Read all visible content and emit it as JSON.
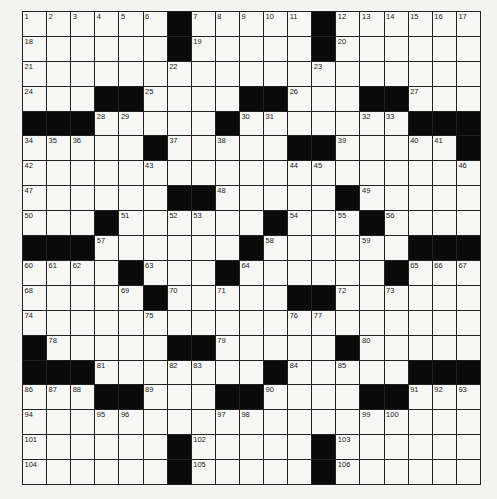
{
  "puzzle": {
    "rows": 19,
    "cols": 19,
    "grid": [
      "......#.....#......",
      "......#.....#......",
      "...................",
      "...##....##...##...",
      "###.....#.......###",
      ".....#.....##.....#",
      "...................",
      "......##.....#.....",
      "...#......#...#....",
      "###......#......###",
      "....#...#......#...",
      ".....#.....##......",
      "...................",
      "#.....##.....#.....",
      "###.......#.....###",
      "...##...##....##...",
      "...................",
      "......#.....#......",
      "......#.....#......"
    ],
    "numbers": [
      {
        "r": 0,
        "c": 0,
        "n": "1"
      },
      {
        "r": 0,
        "c": 1,
        "n": "2"
      },
      {
        "r": 0,
        "c": 2,
        "n": "3"
      },
      {
        "r": 0,
        "c": 3,
        "n": "4"
      },
      {
        "r": 0,
        "c": 4,
        "n": "5"
      },
      {
        "r": 0,
        "c": 5,
        "n": "6"
      },
      {
        "r": 0,
        "c": 7,
        "n": "7"
      },
      {
        "r": 0,
        "c": 8,
        "n": "8"
      },
      {
        "r": 0,
        "c": 9,
        "n": "9"
      },
      {
        "r": 0,
        "c": 10,
        "n": "10"
      },
      {
        "r": 0,
        "c": 11,
        "n": "11"
      },
      {
        "r": 0,
        "c": 13,
        "n": "12"
      },
      {
        "r": 0,
        "c": 14,
        "n": "13"
      },
      {
        "r": 0,
        "c": 15,
        "n": "14"
      },
      {
        "r": 0,
        "c": 16,
        "n": "15"
      },
      {
        "r": 0,
        "c": 17,
        "n": "16"
      },
      {
        "r": 0,
        "c": 18,
        "n": "17"
      },
      {
        "r": 1,
        "c": 0,
        "n": "18"
      },
      {
        "r": 1,
        "c": 7,
        "n": "19"
      },
      {
        "r": 1,
        "c": 13,
        "n": "20"
      },
      {
        "r": 2,
        "c": 0,
        "n": "21"
      },
      {
        "r": 2,
        "c": 6,
        "n": "22"
      },
      {
        "r": 2,
        "c": 12,
        "n": "23"
      },
      {
        "r": 3,
        "c": 0,
        "n": "24"
      },
      {
        "r": 3,
        "c": 5,
        "n": "25"
      },
      {
        "r": 3,
        "c": 11,
        "n": "26"
      },
      {
        "r": 3,
        "c": 16,
        "n": "27"
      },
      {
        "r": 4,
        "c": 3,
        "n": "28"
      },
      {
        "r": 4,
        "c": 4,
        "n": "29"
      },
      {
        "r": 4,
        "c": 9,
        "n": "30"
      },
      {
        "r": 4,
        "c": 10,
        "n": "31"
      },
      {
        "r": 4,
        "c": 14,
        "n": "32"
      },
      {
        "r": 4,
        "c": 15,
        "n": "33"
      },
      {
        "r": 5,
        "c": 0,
        "n": "34"
      },
      {
        "r": 5,
        "c": 1,
        "n": "35"
      },
      {
        "r": 5,
        "c": 2,
        "n": "36"
      },
      {
        "r": 5,
        "c": 6,
        "n": "37"
      },
      {
        "r": 5,
        "c": 8,
        "n": "38"
      },
      {
        "r": 5,
        "c": 13,
        "n": "39"
      },
      {
        "r": 5,
        "c": 16,
        "n": "40"
      },
      {
        "r": 5,
        "c": 17,
        "n": "41"
      },
      {
        "r": 6,
        "c": 0,
        "n": "42"
      },
      {
        "r": 6,
        "c": 5,
        "n": "43"
      },
      {
        "r": 6,
        "c": 11,
        "n": "44"
      },
      {
        "r": 6,
        "c": 12,
        "n": "45"
      },
      {
        "r": 6,
        "c": 18,
        "n": "46"
      },
      {
        "r": 7,
        "c": 0,
        "n": "47"
      },
      {
        "r": 7,
        "c": 8,
        "n": "48"
      },
      {
        "r": 7,
        "c": 14,
        "n": "49"
      },
      {
        "r": 8,
        "c": 0,
        "n": "50"
      },
      {
        "r": 8,
        "c": 4,
        "n": "51"
      },
      {
        "r": 8,
        "c": 6,
        "n": "52"
      },
      {
        "r": 8,
        "c": 7,
        "n": "53"
      },
      {
        "r": 8,
        "c": 11,
        "n": "54"
      },
      {
        "r": 8,
        "c": 13,
        "n": "55"
      },
      {
        "r": 8,
        "c": 15,
        "n": "56"
      },
      {
        "r": 9,
        "c": 3,
        "n": "57"
      },
      {
        "r": 9,
        "c": 10,
        "n": "58"
      },
      {
        "r": 9,
        "c": 14,
        "n": "59"
      },
      {
        "r": 10,
        "c": 0,
        "n": "60"
      },
      {
        "r": 10,
        "c": 1,
        "n": "61"
      },
      {
        "r": 10,
        "c": 2,
        "n": "62"
      },
      {
        "r": 10,
        "c": 5,
        "n": "63"
      },
      {
        "r": 10,
        "c": 9,
        "n": "64"
      },
      {
        "r": 10,
        "c": 16,
        "n": "65"
      },
      {
        "r": 10,
        "c": 17,
        "n": "66"
      },
      {
        "r": 10,
        "c": 18,
        "n": "67"
      },
      {
        "r": 11,
        "c": 0,
        "n": "68"
      },
      {
        "r": 11,
        "c": 4,
        "n": "69"
      },
      {
        "r": 11,
        "c": 6,
        "n": "70"
      },
      {
        "r": 11,
        "c": 8,
        "n": "71"
      },
      {
        "r": 11,
        "c": 13,
        "n": "72"
      },
      {
        "r": 11,
        "c": 15,
        "n": "73"
      },
      {
        "r": 12,
        "c": 0,
        "n": "74"
      },
      {
        "r": 12,
        "c": 5,
        "n": "75"
      },
      {
        "r": 12,
        "c": 11,
        "n": "76"
      },
      {
        "r": 12,
        "c": 12,
        "n": "77"
      },
      {
        "r": 13,
        "c": 1,
        "n": "78"
      },
      {
        "r": 13,
        "c": 8,
        "n": "79"
      },
      {
        "r": 13,
        "c": 14,
        "n": "80"
      },
      {
        "r": 14,
        "c": 3,
        "n": "81"
      },
      {
        "r": 14,
        "c": 6,
        "n": "82"
      },
      {
        "r": 14,
        "c": 7,
        "n": "83"
      },
      {
        "r": 14,
        "c": 11,
        "n": "84"
      },
      {
        "r": 14,
        "c": 13,
        "n": "85"
      },
      {
        "r": 15,
        "c": 0,
        "n": "86"
      },
      {
        "r": 15,
        "c": 1,
        "n": "87"
      },
      {
        "r": 15,
        "c": 2,
        "n": "88"
      },
      {
        "r": 15,
        "c": 5,
        "n": "89"
      },
      {
        "r": 15,
        "c": 10,
        "n": "90"
      },
      {
        "r": 15,
        "c": 16,
        "n": "91"
      },
      {
        "r": 15,
        "c": 17,
        "n": "92"
      },
      {
        "r": 15,
        "c": 18,
        "n": "93"
      },
      {
        "r": 16,
        "c": 0,
        "n": "94"
      },
      {
        "r": 16,
        "c": 3,
        "n": "95"
      },
      {
        "r": 16,
        "c": 4,
        "n": "96"
      },
      {
        "r": 16,
        "c": 8,
        "n": "97"
      },
      {
        "r": 16,
        "c": 9,
        "n": "98"
      },
      {
        "r": 16,
        "c": 14,
        "n": "99"
      },
      {
        "r": 16,
        "c": 15,
        "n": "100"
      },
      {
        "r": 17,
        "c": 0,
        "n": "101"
      },
      {
        "r": 17,
        "c": 7,
        "n": "102"
      },
      {
        "r": 17,
        "c": 13,
        "n": "103"
      },
      {
        "r": 18,
        "c": 0,
        "n": "104"
      },
      {
        "r": 18,
        "c": 7,
        "n": "105"
      },
      {
        "r": 18,
        "c": 13,
        "n": "106"
      }
    ]
  }
}
